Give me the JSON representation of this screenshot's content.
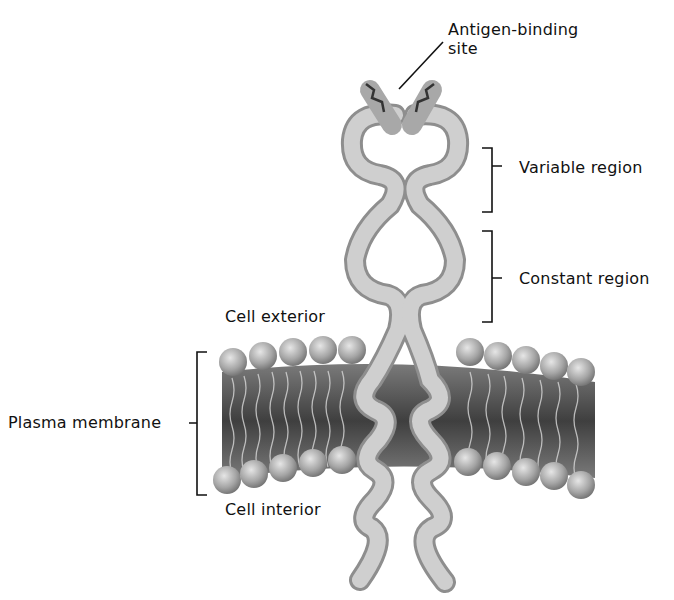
{
  "diagram": {
    "labels": {
      "antigen_binding_line1": "Antigen-binding",
      "antigen_binding_line2": "site",
      "variable_region": "Variable region",
      "constant_region": "Constant region",
      "cell_exterior": "Cell exterior",
      "plasma_membrane": "Plasma membrane",
      "cell_interior": "Cell interior"
    },
    "colors": {
      "protein": "#c8c8c8",
      "protein_shadow": "#8e8e8e",
      "membrane_core": "#555555",
      "lipid_head": "#9a9a9a",
      "line": "#111111"
    }
  }
}
